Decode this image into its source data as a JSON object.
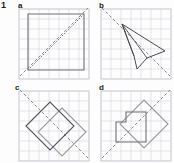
{
  "question": {
    "number": "1"
  },
  "styles": {
    "grid_line": "#d9d9de",
    "grid_border": "#c9c9cf",
    "shape_stroke": "#6f6f77",
    "shape_stroke_dark": "#4a4a52",
    "mirror_stroke": "#8a8a92",
    "label_color": "#1b1b1b",
    "background": "#fdfdfd"
  },
  "panels": [
    {
      "id": "a",
      "label": "a",
      "grid": {
        "cols": 7,
        "rows": 7,
        "cell": 10,
        "x": 0,
        "y": 0
      },
      "mirror": {
        "type": "dashed-line",
        "x1": 2,
        "y1": 68,
        "x2": 70,
        "y2": 0,
        "description": "mirror line from bottom-left to top-right"
      },
      "shapes": [
        {
          "name": "square-object",
          "type": "polygon",
          "points": "10,6 66,6 66,62 10,62",
          "role": "object"
        },
        {
          "name": "diagonal-of-square",
          "type": "line",
          "x1": 10,
          "y1": 62,
          "x2": 66,
          "y2": 6,
          "role": "construction"
        }
      ]
    },
    {
      "id": "b",
      "label": "b",
      "grid": {
        "cols": 7,
        "rows": 7,
        "cell": 10,
        "x": 0,
        "y": 0
      },
      "mirror": {
        "type": "dashed-line",
        "x1": 2,
        "y1": 0,
        "x2": 70,
        "y2": 68,
        "description": "mirror line from top-left to bottom-right"
      },
      "shapes": [
        {
          "name": "kite-object",
          "type": "polygon",
          "points": "22,16 65,43 47,50 37,61 34,48",
          "role": "object"
        },
        {
          "name": "kite-inner-line-1",
          "type": "line",
          "x1": 22,
          "y1": 16,
          "x2": 47,
          "y2": 50,
          "role": "construction"
        },
        {
          "name": "kite-inner-line-2",
          "type": "line",
          "x1": 22,
          "y1": 16,
          "x2": 34,
          "y2": 48,
          "role": "construction"
        }
      ]
    },
    {
      "id": "c",
      "label": "c",
      "grid": {
        "cols": 7,
        "rows": 7,
        "cell": 10,
        "x": 0,
        "y": 0
      },
      "mirror": {
        "type": "dashed-line",
        "x1": 2,
        "y1": 0,
        "x2": 70,
        "y2": 68,
        "description": "mirror line from top-left to bottom-right"
      },
      "shapes": [
        {
          "name": "rectangle-object",
          "type": "polygon",
          "points": "44,18 68,42 44,66 20,42",
          "role": "object"
        },
        {
          "name": "rectangle-image",
          "type": "polygon",
          "points": "8,36 32,12 56,36 32,60",
          "role": "image"
        }
      ]
    },
    {
      "id": "d",
      "label": "d",
      "grid": {
        "cols": 7,
        "rows": 7,
        "cell": 10,
        "x": 0,
        "y": 0
      },
      "mirror": {
        "type": "dashed-line",
        "x1": 2,
        "y1": 68,
        "x2": 70,
        "y2": 0,
        "description": "mirror line from bottom-left to top-right"
      },
      "shapes": [
        {
          "name": "rotated-rectangle-object",
          "type": "polygon",
          "points": "44,10 68,34 44,58 20,34",
          "role": "object"
        },
        {
          "name": "L-shape-image",
          "type": "polygon",
          "points": "16,32 26,32 26,22 46,22 46,52 16,52",
          "role": "image"
        }
      ]
    }
  ]
}
